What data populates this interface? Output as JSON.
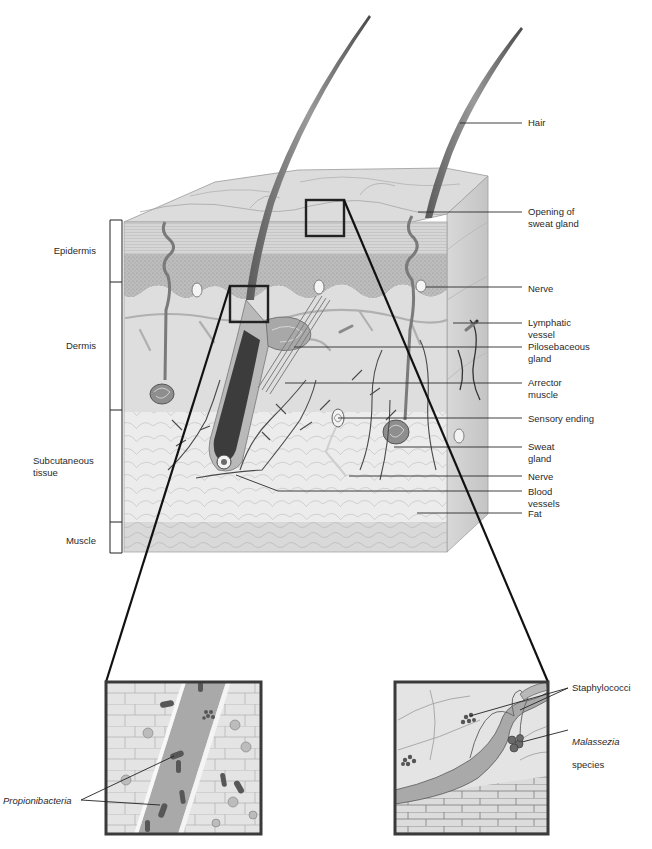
{
  "diagram": {
    "layers_bracket": [
      {
        "id": "epidermis",
        "label": "Epidermis"
      },
      {
        "id": "dermis",
        "label": "Dermis"
      },
      {
        "id": "subcutaneous",
        "label": "Subcutaneous\ntissue"
      },
      {
        "id": "muscle",
        "label": "Muscle"
      }
    ],
    "right_labels": [
      {
        "id": "hair",
        "label": "Hair"
      },
      {
        "id": "opening-sweat-gland",
        "label": "Opening of\nsweat gland"
      },
      {
        "id": "nerve-upper",
        "label": "Nerve"
      },
      {
        "id": "lymphatic-vessel",
        "label": "Lymphatic\nvessel"
      },
      {
        "id": "pilosebaceous-gland",
        "label": "Pilosebaceous\ngland"
      },
      {
        "id": "arrector-muscle",
        "label": "Arrector\nmuscle"
      },
      {
        "id": "sensory-ending",
        "label": "Sensory ending"
      },
      {
        "id": "sweat-gland",
        "label": "Sweat\ngland"
      },
      {
        "id": "nerve-lower",
        "label": "Nerve"
      },
      {
        "id": "blood-vessels",
        "label": "Blood\nvessels"
      },
      {
        "id": "fat",
        "label": "Fat"
      }
    ],
    "insets": {
      "left": {
        "label": "Propionibacteria",
        "italic": true,
        "region": "hair follicle"
      },
      "right": {
        "labels": [
          {
            "id": "staphylococci",
            "label": "Staphylococci",
            "italic": false
          },
          {
            "id": "malassezia",
            "label_italic": "Malassezia",
            "label_plain": "species"
          }
        ],
        "region": "skin surface / sweat gland opening"
      }
    },
    "colors": {
      "background": "#ffffff",
      "tissue_light": "#e6e6e6",
      "tissue_mid": "#cfcfcf",
      "tissue_dark": "#9a9a9a",
      "line": "#1a1a1a",
      "label_text": "#2a2a2a"
    }
  }
}
